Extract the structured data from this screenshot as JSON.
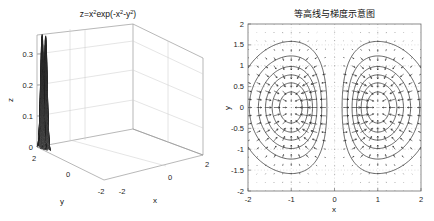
{
  "figure": {
    "background_color": "#ffffff",
    "width": 434,
    "height": 221,
    "panel_count": 2
  },
  "chart_data": [
    {
      "id": "surface-plot",
      "type": "surface",
      "title": "z=x^2exp(-x^2-y^2)",
      "title_parts": {
        "lead": "z=x",
        "sup1": "2",
        "mid": "exp(-x",
        "sup2": "2",
        "mid2": "-y",
        "sup3": "2",
        "tail": ")"
      },
      "function": "z = x^2 * exp(-x^2 - y^2)",
      "xlabel": "x",
      "ylabel": "y",
      "zlabel": "z",
      "xlim": [
        -2,
        2
      ],
      "ylim": [
        -2,
        2
      ],
      "zlim": [
        0,
        0.35
      ],
      "xticks": [
        "-2",
        "0",
        "2"
      ],
      "yticks": [
        "2",
        "0",
        "-2"
      ],
      "zticks": [
        "0",
        "0.1",
        "0.2",
        "0.3"
      ],
      "zticks_values": [
        0,
        0.1,
        0.2,
        0.3
      ],
      "grid": true,
      "mesh_color": "#2b2b2b",
      "face_color": "#ffffff",
      "view": "azimuth -37.5, elevation 30",
      "peaks": [
        {
          "x": -1,
          "y": 0,
          "z": 0.3679
        },
        {
          "x": 1,
          "y": 0,
          "z": 0.3679
        }
      ],
      "mesh_rows": 41,
      "mesh_cols": 41,
      "notes": "Two symmetric peaks at x=+/-1, y=0; z max ~0.368"
    },
    {
      "id": "contour-quiver-plot",
      "type": "contour",
      "title": "等高线与梯度示意图",
      "xlabel": "x",
      "ylabel": "y",
      "xlim": [
        -2,
        2
      ],
      "ylim": [
        -2,
        2
      ],
      "xticks": [
        "-2",
        "-1",
        "0",
        "1",
        "2"
      ],
      "xticks_values": [
        -2,
        -1,
        0,
        1,
        2
      ],
      "yticks": [
        "2",
        "1.5",
        "1",
        "0.5",
        "0",
        "-0.5",
        "-1",
        "-1.5",
        "-2"
      ],
      "yticks_values": [
        2,
        1.5,
        1,
        0.5,
        0,
        -0.5,
        -1,
        -1.5,
        -2
      ],
      "grid": true,
      "grid_style": "dotted",
      "contour_levels": [
        0.03,
        0.08,
        0.14,
        0.2,
        0.26,
        0.32
      ],
      "contour_color": "#222222",
      "quiver": {
        "enabled": true,
        "color": "#1a1a1a",
        "grid_nx": 21,
        "grid_ny": 21,
        "field": "gradient of z = x^2 exp(-x^2-y^2)"
      },
      "centers": [
        {
          "x": -1,
          "y": 0
        },
        {
          "x": 1,
          "y": 0
        }
      ],
      "notes": "Concentric elliptical contours around the two maxima with gradient arrows"
    }
  ]
}
